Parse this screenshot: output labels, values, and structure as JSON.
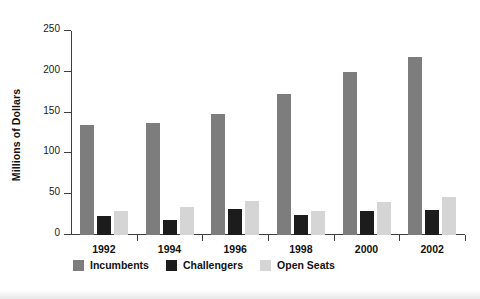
{
  "chart_data": {
    "type": "bar",
    "title": "",
    "xlabel": "",
    "ylabel": "Millions of Dollars",
    "categories": [
      "1992",
      "1994",
      "1996",
      "1998",
      "2000",
      "2002"
    ],
    "series": [
      {
        "name": "Incumbents",
        "color": "#7d7d7d",
        "values": [
          135,
          137,
          148,
          173,
          200,
          218
        ]
      },
      {
        "name": "Challengers",
        "color": "#1c1c1c",
        "values": [
          23,
          18,
          32,
          24,
          29,
          31
        ]
      },
      {
        "name": "Open Seats",
        "color": "#d5d5d5",
        "values": [
          30,
          34,
          42,
          29,
          41,
          46
        ]
      }
    ],
    "ylim": [
      0,
      250
    ],
    "yticks": [
      0,
      50,
      100,
      150,
      200,
      250
    ],
    "ytick_labels": [
      "0",
      "50",
      "100",
      "150",
      "200",
      "250"
    ],
    "grid": false,
    "legend_position": "bottom-left",
    "axis_color": "#3d3d3d"
  }
}
